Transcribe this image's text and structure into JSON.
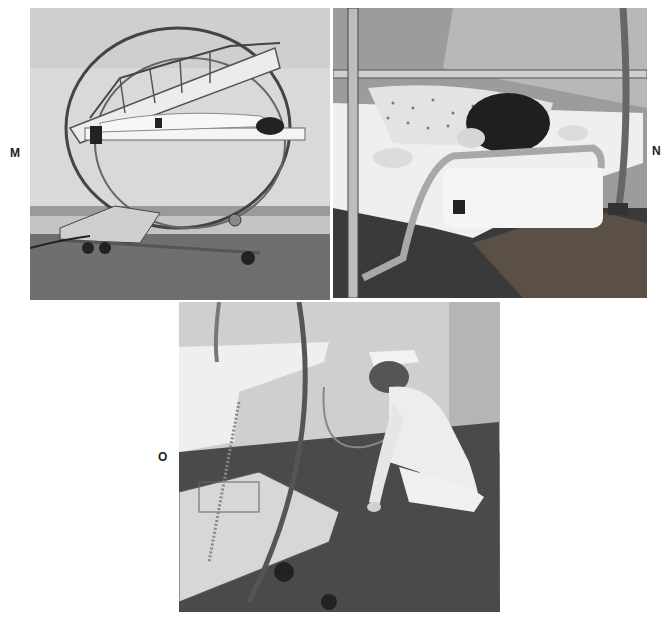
{
  "figure": {
    "panels": [
      {
        "label": "M",
        "description": "Circular electric bed (CircOlectric frame) with patient lying prone between anterior and posterior frames, wheeled base, photographed in hallway",
        "tone": "grayscale"
      },
      {
        "label": "N",
        "description": "Close-up of patient with dark hair lying prone on bed frame, patterned gown, face resting on padded support, chrome tube rails",
        "tone": "grayscale"
      },
      {
        "label": "O",
        "description": "Nurse in white uniform and cap kneeling on carpet adjusting the base of the circular bed, cord plugged into wall",
        "tone": "grayscale"
      }
    ]
  }
}
